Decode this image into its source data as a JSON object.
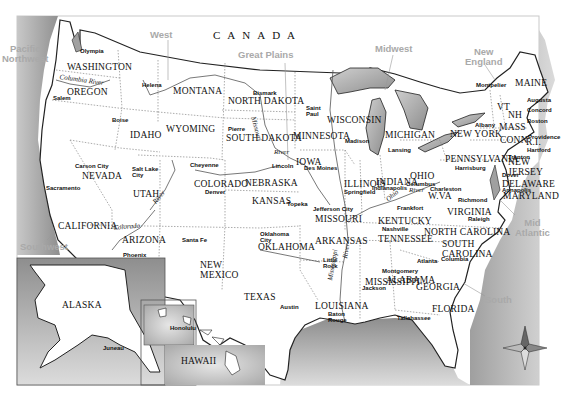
{
  "map": {
    "title": "United States",
    "country_label": "CANADA",
    "colors": {
      "land": "#ffffff",
      "water": "#b8b8b8",
      "border": "#222222",
      "region_label": "#a9a9a9"
    },
    "regions": [
      {
        "name": "Pacific\nNorthwest",
        "x": 2,
        "y": 44
      },
      {
        "name": "West",
        "x": 150,
        "y": 30
      },
      {
        "name": "Great Plains",
        "x": 238,
        "y": 50
      },
      {
        "name": "Midwest",
        "x": 375,
        "y": 44
      },
      {
        "name": "New\nEngland",
        "x": 465,
        "y": 47
      },
      {
        "name": "Mid\nAtlantic",
        "x": 515,
        "y": 218
      },
      {
        "name": "Southwest",
        "x": 20,
        "y": 242
      },
      {
        "name": "South",
        "x": 485,
        "y": 295
      }
    ],
    "states": [
      {
        "name": "WASHINGTON",
        "x": 67,
        "y": 63
      },
      {
        "name": "OREGON",
        "x": 67,
        "y": 88
      },
      {
        "name": "IDAHO",
        "x": 130,
        "y": 131
      },
      {
        "name": "MONTANA",
        "x": 173,
        "y": 87
      },
      {
        "name": "WYOMING",
        "x": 166,
        "y": 125
      },
      {
        "name": "NORTH DAKOTA",
        "x": 228,
        "y": 97
      },
      {
        "name": "SOUTH DAKOTA",
        "x": 226,
        "y": 134
      },
      {
        "name": "MINNESOTA",
        "x": 293,
        "y": 132
      },
      {
        "name": "WISCONSIN",
        "x": 327,
        "y": 116
      },
      {
        "name": "MICHIGAN",
        "x": 385,
        "y": 131
      },
      {
        "name": "NEW YORK",
        "x": 450,
        "y": 130
      },
      {
        "name": "MAINE",
        "x": 515,
        "y": 79
      },
      {
        "name": "VT",
        "x": 497,
        "y": 103
      },
      {
        "name": "NH",
        "x": 508,
        "y": 111
      },
      {
        "name": "MASS",
        "x": 499,
        "y": 123
      },
      {
        "name": "CONN",
        "x": 500,
        "y": 136
      },
      {
        "name": "R.I.",
        "x": 526,
        "y": 138
      },
      {
        "name": "NEW\nJERSEY",
        "x": 508,
        "y": 158
      },
      {
        "name": "PENNSYLVANIA",
        "x": 445,
        "y": 155
      },
      {
        "name": "DELAWARE",
        "x": 502,
        "y": 180
      },
      {
        "name": "MARYLAND",
        "x": 503,
        "y": 192
      },
      {
        "name": "NEVADA",
        "x": 82,
        "y": 172
      },
      {
        "name": "UTAH",
        "x": 133,
        "y": 190
      },
      {
        "name": "COLORADO",
        "x": 194,
        "y": 180
      },
      {
        "name": "NEBRASKA",
        "x": 245,
        "y": 179
      },
      {
        "name": "IOWA",
        "x": 296,
        "y": 158
      },
      {
        "name": "ILLINOIS",
        "x": 344,
        "y": 180
      },
      {
        "name": "INDIANA",
        "x": 376,
        "y": 178
      },
      {
        "name": "OHIO",
        "x": 410,
        "y": 172
      },
      {
        "name": "W.VA",
        "x": 428,
        "y": 192
      },
      {
        "name": "VIRGINIA",
        "x": 447,
        "y": 208
      },
      {
        "name": "KENTUCKY",
        "x": 378,
        "y": 217
      },
      {
        "name": "KANSAS",
        "x": 252,
        "y": 197
      },
      {
        "name": "MISSOURI",
        "x": 315,
        "y": 215
      },
      {
        "name": "CALIFORNIA",
        "x": 58,
        "y": 222
      },
      {
        "name": "ARIZONA",
        "x": 122,
        "y": 236
      },
      {
        "name": "NEW\nMEXICO",
        "x": 200,
        "y": 261
      },
      {
        "name": "OKLAHOMA",
        "x": 258,
        "y": 243
      },
      {
        "name": "ARKANSAS",
        "x": 315,
        "y": 237
      },
      {
        "name": "TENNESSEE",
        "x": 378,
        "y": 235
      },
      {
        "name": "NORTH CAROLINA",
        "x": 424,
        "y": 228
      },
      {
        "name": "SOUTH\nCAROLINA",
        "x": 442,
        "y": 240
      },
      {
        "name": "MISSISSIPPI",
        "x": 365,
        "y": 278
      },
      {
        "name": "ALABAMA",
        "x": 386,
        "y": 276
      },
      {
        "name": "GEORGIA",
        "x": 416,
        "y": 283
      },
      {
        "name": "TEXAS",
        "x": 244,
        "y": 293
      },
      {
        "name": "LOUISIANA",
        "x": 315,
        "y": 302
      },
      {
        "name": "FLORIDA",
        "x": 432,
        "y": 305
      },
      {
        "name": "ALASKA",
        "x": 62,
        "y": 301
      },
      {
        "name": "HAWAII",
        "x": 181,
        "y": 357
      }
    ],
    "cities": [
      {
        "name": "Olympia",
        "x": 80,
        "y": 48
      },
      {
        "name": "Salem",
        "x": 53,
        "y": 95
      },
      {
        "name": "Boise",
        "x": 112,
        "y": 117
      },
      {
        "name": "Helena",
        "x": 142,
        "y": 82
      },
      {
        "name": "Bismark",
        "x": 253,
        "y": 90
      },
      {
        "name": "Pierre",
        "x": 228,
        "y": 126
      },
      {
        "name": "Saint\nPaul",
        "x": 306,
        "y": 105
      },
      {
        "name": "Madison",
        "x": 345,
        "y": 138
      },
      {
        "name": "Lansing",
        "x": 388,
        "y": 147
      },
      {
        "name": "Montpelier",
        "x": 476,
        "y": 82
      },
      {
        "name": "Augusta",
        "x": 527,
        "y": 97
      },
      {
        "name": "Concord",
        "x": 527,
        "y": 107
      },
      {
        "name": "Albany",
        "x": 475,
        "y": 122
      },
      {
        "name": "Boston",
        "x": 527,
        "y": 118
      },
      {
        "name": "Providence",
        "x": 528,
        "y": 134
      },
      {
        "name": "Hartford",
        "x": 527,
        "y": 147
      },
      {
        "name": "Trenton",
        "x": 508,
        "y": 154
      },
      {
        "name": "Harrisburg",
        "x": 455,
        "y": 165
      },
      {
        "name": "Dover",
        "x": 502,
        "y": 172
      },
      {
        "name": "Annapolis",
        "x": 502,
        "y": 187
      },
      {
        "name": "Carson City",
        "x": 75,
        "y": 163
      },
      {
        "name": "Sacramento",
        "x": 46,
        "y": 185
      },
      {
        "name": "Salt Lake\nCity",
        "x": 132,
        "y": 166
      },
      {
        "name": "Cheyenne",
        "x": 190,
        "y": 162
      },
      {
        "name": "Denver",
        "x": 205,
        "y": 189
      },
      {
        "name": "Lincoln",
        "x": 272,
        "y": 163
      },
      {
        "name": "Des Moines",
        "x": 304,
        "y": 165
      },
      {
        "name": "Springfield",
        "x": 344,
        "y": 189
      },
      {
        "name": "Indianapolis",
        "x": 372,
        "y": 185
      },
      {
        "name": "Columbus",
        "x": 406,
        "y": 181
      },
      {
        "name": "Charleston",
        "x": 430,
        "y": 186
      },
      {
        "name": "Richmond",
        "x": 458,
        "y": 197
      },
      {
        "name": "Frankfort",
        "x": 397,
        "y": 205
      },
      {
        "name": "Topeka",
        "x": 287,
        "y": 201
      },
      {
        "name": "Jefferson City",
        "x": 313,
        "y": 206
      },
      {
        "name": "Nashville",
        "x": 382,
        "y": 226
      },
      {
        "name": "Raleigh",
        "x": 468,
        "y": 216
      },
      {
        "name": "Santa Fe",
        "x": 182,
        "y": 237
      },
      {
        "name": "Phoenix",
        "x": 123,
        "y": 252
      },
      {
        "name": "Oklahoma\nCity",
        "x": 260,
        "y": 231
      },
      {
        "name": "Little\nRock",
        "x": 323,
        "y": 257
      },
      {
        "name": "Atlanta",
        "x": 417,
        "y": 258
      },
      {
        "name": "Columbia",
        "x": 441,
        "y": 256
      },
      {
        "name": "Montgomery",
        "x": 382,
        "y": 268
      },
      {
        "name": "Jackson",
        "x": 362,
        "y": 285
      },
      {
        "name": "Austin",
        "x": 280,
        "y": 304
      },
      {
        "name": "Baton\nRouge",
        "x": 328,
        "y": 311
      },
      {
        "name": "Tallahassee",
        "x": 397,
        "y": 315
      },
      {
        "name": "Honolulu",
        "x": 170,
        "y": 325
      },
      {
        "name": "Juneau",
        "x": 103,
        "y": 345
      }
    ],
    "rivers": [
      {
        "name": "Columbia River",
        "x": 60,
        "y": 74,
        "rotate": 8
      },
      {
        "name": "Missouri",
        "x": 256,
        "y": 116,
        "rotate": 75
      },
      {
        "name": "River",
        "x": 274,
        "y": 149,
        "rotate": 0
      },
      {
        "name": "Colorado",
        "x": 113,
        "y": 225,
        "rotate": -5
      },
      {
        "name": "River",
        "x": 152,
        "y": 201,
        "rotate": -50
      },
      {
        "name": "Ohio",
        "x": 385,
        "y": 198,
        "rotate": -40
      },
      {
        "name": "River",
        "x": 409,
        "y": 187,
        "rotate": 0
      },
      {
        "name": "Mississippi",
        "x": 327,
        "y": 280,
        "rotate": -80
      },
      {
        "name": "River",
        "x": 342,
        "y": 258,
        "rotate": -80
      }
    ],
    "compass": {
      "label": "compass-rose",
      "x": 525,
      "y": 348
    }
  }
}
